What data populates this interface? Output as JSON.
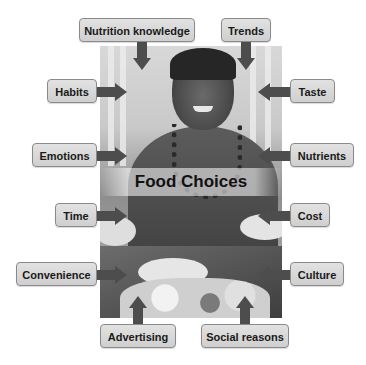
{
  "diagram": {
    "center_label": "Food Choices",
    "colors": {
      "box_fill": "#d8d8d8",
      "box_border": "#8a8a8a",
      "arrow": "#4d4d4d",
      "text": "#1a1a1a"
    },
    "factors": [
      {
        "label": "Nutrition knowledge",
        "position": "top-left",
        "arrow": "down"
      },
      {
        "label": "Trends",
        "position": "top-right",
        "arrow": "down"
      },
      {
        "label": "Habits",
        "position": "left",
        "arrow": "right"
      },
      {
        "label": "Taste",
        "position": "right",
        "arrow": "left"
      },
      {
        "label": "Emotions",
        "position": "left",
        "arrow": "right"
      },
      {
        "label": "Nutrients",
        "position": "right",
        "arrow": "left"
      },
      {
        "label": "Time",
        "position": "left",
        "arrow": "right"
      },
      {
        "label": "Cost",
        "position": "right",
        "arrow": "left"
      },
      {
        "label": "Convenience",
        "position": "left",
        "arrow": "right"
      },
      {
        "label": "Culture",
        "position": "right",
        "arrow": "left"
      },
      {
        "label": "Advertising",
        "position": "bottom-left",
        "arrow": "up"
      },
      {
        "label": "Social reasons",
        "position": "bottom-right",
        "arrow": "up"
      }
    ]
  }
}
